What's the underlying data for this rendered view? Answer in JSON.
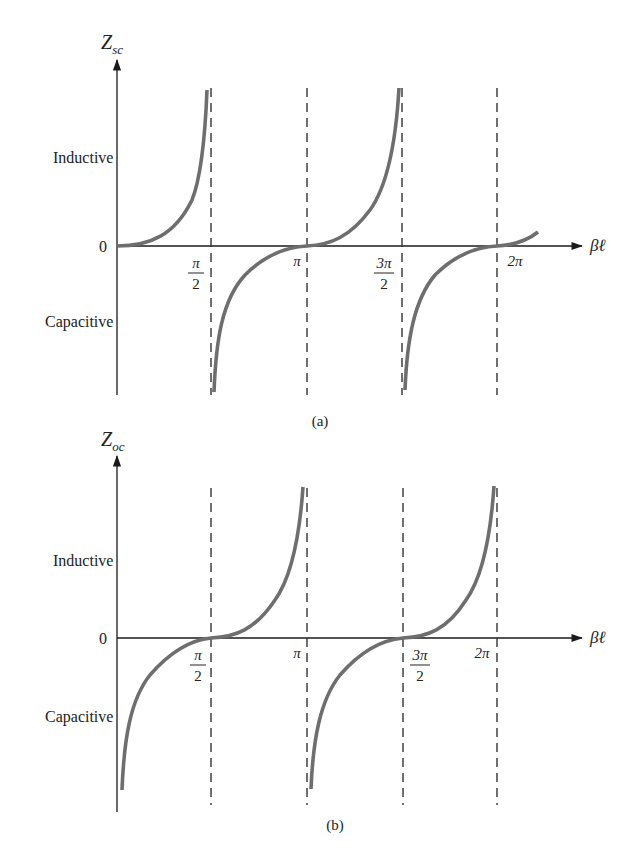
{
  "figure": {
    "panels": [
      {
        "id": "a",
        "caption": "(a)",
        "y_axis_label_main": "Z",
        "y_axis_label_sub": "sc",
        "x_axis_label": "βℓ",
        "region_upper": "Inductive",
        "region_lower": "Capacitive",
        "origin_label": "0",
        "ticks": [
          {
            "num": "π",
            "den": "2",
            "pos": "pi/2"
          },
          {
            "text": "π",
            "pos": "pi"
          },
          {
            "num": "3π",
            "den": "2",
            "pos": "3pi/2"
          },
          {
            "text": "2π",
            "pos": "2pi"
          }
        ],
        "function": "tan(βℓ)",
        "description": "Short-circuited line input impedance: inductive for 0<βℓ<π/2, capacitive for π/2<βℓ<π, periodic with π; asymptotes at π/2 and 3π/2"
      },
      {
        "id": "b",
        "caption": "(b)",
        "y_axis_label_main": "Z",
        "y_axis_label_sub": "oc",
        "x_axis_label": "βℓ",
        "region_upper": "Inductive",
        "region_lower": "Capacitive",
        "origin_label": "0",
        "ticks": [
          {
            "num": "π",
            "den": "2",
            "pos": "pi/2"
          },
          {
            "text": "π",
            "pos": "pi"
          },
          {
            "num": "3π",
            "den": "2",
            "pos": "3pi/2"
          },
          {
            "text": "2π",
            "pos": "2pi"
          }
        ],
        "function": "-cot(βℓ)",
        "description": "Open-circuited line input impedance: capacitive for 0<βℓ<π/2, inductive for π/2<βℓ<π, periodic with π; asymptotes at π and 2π"
      }
    ]
  }
}
